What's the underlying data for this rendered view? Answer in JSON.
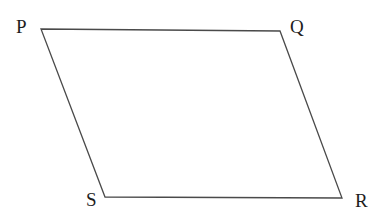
{
  "figure": {
    "name": "parallelogram-pqrs",
    "shape_type": "parallelogram",
    "background_color": "#ffffff",
    "stroke_color": "#4a4a4a",
    "stroke_width": 1.3,
    "fill": "none",
    "label_color": "#1d1d1d",
    "label_font_size": 19,
    "canvas": {
      "width": 381,
      "height": 222
    },
    "vertices": [
      {
        "id": "P",
        "label": "P",
        "x": 41,
        "y": 29,
        "label_x": 16,
        "label_y": 17
      },
      {
        "id": "Q",
        "label": "Q",
        "x": 280,
        "y": 31,
        "label_x": 290,
        "label_y": 17
      },
      {
        "id": "R",
        "label": "R",
        "x": 342,
        "y": 198,
        "label_x": 355,
        "label_y": 191
      },
      {
        "id": "S",
        "label": "S",
        "x": 105,
        "y": 197,
        "label_x": 86,
        "label_y": 190
      }
    ],
    "edges": [
      {
        "id": "PQ",
        "from": "P",
        "to": "Q"
      },
      {
        "id": "QR",
        "from": "Q",
        "to": "R"
      },
      {
        "id": "RS",
        "from": "R",
        "to": "S"
      },
      {
        "id": "SP",
        "from": "S",
        "to": "P"
      }
    ],
    "path": "M 41,29 L 280,31 L 342,198 L 105,197 Z"
  }
}
